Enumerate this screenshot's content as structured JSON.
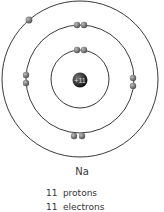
{
  "diagram": {
    "type": "bohr-model",
    "element_symbol": "Na",
    "nucleus_charge": "+11",
    "shells": [
      {
        "shell": 1,
        "electrons": 2
      },
      {
        "shell": 2,
        "electrons": 8
      },
      {
        "shell": 3,
        "electrons": 1
      }
    ],
    "counts": [
      {
        "value": "11",
        "label": "protons"
      },
      {
        "value": "11",
        "label": "electrons"
      }
    ]
  }
}
